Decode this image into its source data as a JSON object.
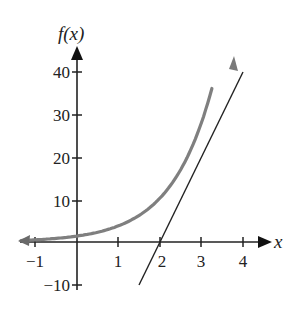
{
  "chart_data": {
    "type": "line",
    "title": "",
    "xlabel": "x",
    "ylabel": "f(x)",
    "xlim": [
      -1.4,
      4.7
    ],
    "ylim": [
      -14,
      47
    ],
    "x_ticks": [
      -1,
      1,
      2,
      3,
      4
    ],
    "x_tick_labels": [
      "−1",
      "1",
      "2",
      "3",
      "4"
    ],
    "y_ticks": [
      -10,
      10,
      20,
      30,
      40
    ],
    "y_tick_labels": [
      "−10",
      "10",
      "20",
      "30",
      "40"
    ],
    "grid": false,
    "legend": null,
    "series": [
      {
        "name": "f(x) exponential curve",
        "color": "#7a7a7a",
        "arrow_both_ends": true,
        "x": [
          -1.4,
          -1,
          -0.5,
          0,
          0.5,
          1,
          1.5,
          2,
          2.5,
          3,
          3.3
        ],
        "y": [
          0.35,
          0.52,
          0.85,
          1.4,
          2.3,
          3.8,
          6.3,
          10.3,
          17.1,
          28.1,
          38.0
        ]
      },
      {
        "name": "tangent line",
        "color": "#222222",
        "x": [
          1.5,
          4.0
        ],
        "y": [
          -10,
          40
        ]
      }
    ]
  },
  "labels": {
    "y_axis": "f(x)",
    "x_axis": "x",
    "xt": [
      "−1",
      "1",
      "2",
      "3",
      "4"
    ],
    "yt": [
      "40",
      "30",
      "20",
      "10",
      "−10"
    ]
  }
}
